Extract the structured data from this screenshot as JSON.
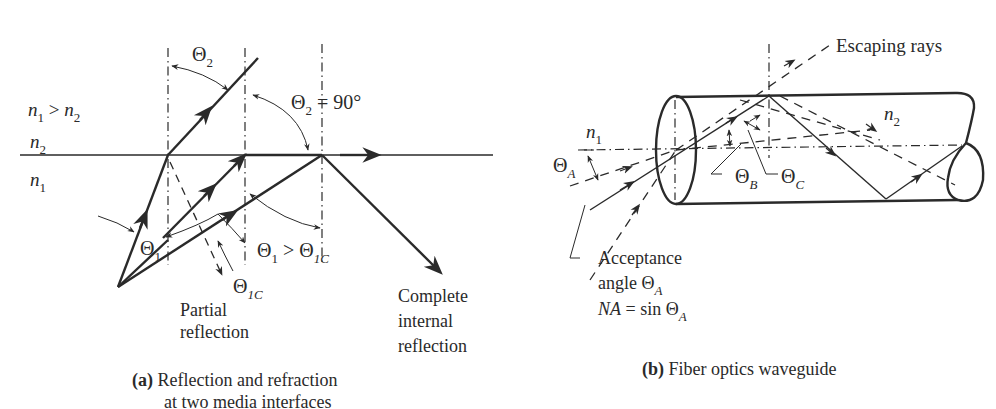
{
  "diagram_a": {
    "caption_tag": "(a)",
    "caption_line1": "Reflection and refraction",
    "caption_line2": "at two media interfaces",
    "labels": {
      "index_relation": {
        "n1": "n",
        "n1_sub": "1",
        "gt": " > ",
        "n2": "n",
        "n2_sub": "2"
      },
      "medium_top": {
        "sym": "n",
        "sub": "2"
      },
      "medium_bottom": {
        "sym": "n",
        "sub": "1"
      },
      "theta2": {
        "sym": "Θ",
        "sub": "2"
      },
      "theta2_90": {
        "sym": "Θ",
        "sub": "2",
        "rest": " = 90°"
      },
      "theta1": {
        "sym": "Θ",
        "sub": "1"
      },
      "theta1c": {
        "sym": "Θ",
        "sub": "1C"
      },
      "theta1_gt_theta1c": {
        "a": "Θ",
        "a_sub": "1",
        "gt": " > ",
        "b": "Θ",
        "b_sub": "1C"
      },
      "partial_reflection": [
        "Partial",
        "reflection"
      ],
      "complete_internal_reflection": [
        "Complete",
        "internal",
        "reflection"
      ]
    }
  },
  "diagram_b": {
    "caption_tag": "(b)",
    "caption_text": "Fiber optics waveguide",
    "labels": {
      "escaping_rays": "Escaping rays",
      "n1": {
        "sym": "n",
        "sub": "1"
      },
      "n2": {
        "sym": "n",
        "sub": "2"
      },
      "theta_a": {
        "sym": "Θ",
        "sub": "A"
      },
      "theta_b": {
        "sym": "Θ",
        "sub": "B"
      },
      "theta_c": {
        "sym": "Θ",
        "sub": "C"
      },
      "acceptance_line1": "Acceptance",
      "acceptance_line2": {
        "text": "angle Θ",
        "sub": "A"
      },
      "na_line": {
        "na": "NA",
        "rest": " = sin Θ",
        "sub": "A"
      }
    }
  },
  "colors": {
    "ink": "#2a2a2a",
    "background": "#ffffff"
  }
}
